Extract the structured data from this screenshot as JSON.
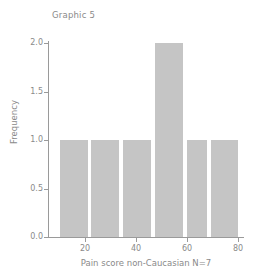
{
  "chart_data": {
    "type": "bar",
    "title": "Graphic 5",
    "subtitle": "",
    "xlabel": "Pain score non-Caucasian N=7",
    "ylabel": "Frequency",
    "xlim": [
      8,
      82
    ],
    "ylim": [
      0,
      2.1
    ],
    "grid": false,
    "legend": null,
    "bar_color": "#c5c5c5",
    "axis_color": "#9a9a9a",
    "text_color": "#8a8a8a",
    "xticks": [
      {
        "value": 20,
        "label": "20"
      },
      {
        "value": 40,
        "label": "40"
      },
      {
        "value": 60,
        "label": "60"
      },
      {
        "value": 80,
        "label": "80"
      }
    ],
    "yticks": [
      {
        "value": 0.0,
        "label": "0.0"
      },
      {
        "value": 0.5,
        "label": "0.5"
      },
      {
        "value": 1.0,
        "label": "1.0"
      },
      {
        "value": 1.5,
        "label": "1.5"
      },
      {
        "value": 2.0,
        "label": "2.0"
      }
    ],
    "bins": [
      {
        "left": 10.0,
        "right": 21.0,
        "value": 1
      },
      {
        "left": 22.5,
        "right": 33.5,
        "value": 1
      },
      {
        "left": 35.0,
        "right": 46.0,
        "value": 1
      },
      {
        "left": 47.5,
        "right": 58.5,
        "value": 2
      },
      {
        "left": 60.0,
        "right": 68.0,
        "value": 1
      },
      {
        "left": 69.5,
        "right": 80.0,
        "value": 1
      }
    ],
    "categories": [
      "10-21",
      "22.5-33.5",
      "35-46",
      "47.5-58.5",
      "60-68",
      "69.5-80"
    ],
    "values": [
      1,
      1,
      1,
      2,
      1,
      1
    ],
    "total_n": 7
  }
}
